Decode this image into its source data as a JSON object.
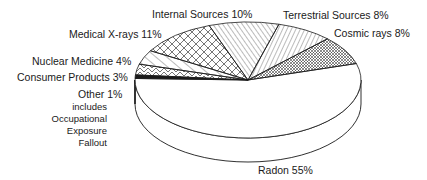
{
  "chart_data": {
    "type": "pie",
    "title": "",
    "style": "3d-exploded-none",
    "categories": [
      "Radon",
      "Cosmic rays",
      "Terrestrial Sources",
      "Internal Sources",
      "Medical X-rays",
      "Nuclear Medicine",
      "Consumer Products",
      "Other"
    ],
    "values": [
      55,
      8,
      8,
      10,
      11,
      4,
      3,
      1
    ],
    "unit": "%",
    "patterns": {
      "Radon": "blank",
      "Cosmic rays": "fine-crosshatch",
      "Terrestrial Sources": "diagonal-right",
      "Internal Sources": "diagonal-left",
      "Medical X-rays": "crosshatch",
      "Nuclear Medicine": "diagonal-left-sparse",
      "Consumer Products": "zigzag",
      "Other": "solid-black"
    },
    "annotations": {
      "Other": [
        "includes",
        "Occupational",
        "Exposure",
        "Fallout"
      ]
    }
  },
  "labels": {
    "internal": "Internal Sources 10%",
    "terrestrial": "Terrestrial Sources 8%",
    "cosmic": "Cosmic rays 8%",
    "medical": "Medical X-rays 11%",
    "nuclear": "Nuclear Medicine 4%",
    "consumer": "Consumer Products 3%",
    "other": "Other  1%",
    "other_note_1": "includes",
    "other_note_2": "Occupational",
    "other_note_3": "Exposure",
    "other_note_4": "Fallout",
    "radon": "Radon  55%"
  },
  "colors": {
    "ink": "#1a1a1a",
    "background": "#ffffff"
  }
}
